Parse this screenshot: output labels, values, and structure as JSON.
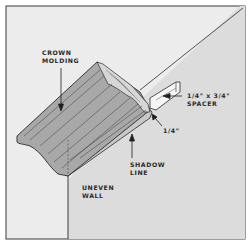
{
  "diagram": {
    "colors": {
      "frame_bg": "#ffffff",
      "frame_border": "#333333",
      "ceiling": "#ececec",
      "back_wall": "#dddddd",
      "left_wall": "#e8e8e8",
      "molding_face": "#a9a9a9",
      "molding_underside": "#c9c9c9",
      "molding_end": "#d4d4d4",
      "spacer": "#f5f5f5",
      "line": "#2b2b2b"
    },
    "labels": {
      "crown_molding_line1": "CROWN",
      "crown_molding_line2": "MOLDING",
      "spacer_line1": "1/4\" x 3/4\"",
      "spacer_line2": "SPACER",
      "gap": "1/4\"",
      "shadow_line1": "SHADOW",
      "shadow_line2": "LINE",
      "wall_line1": "UNEVEN",
      "wall_line2": "WALL"
    }
  }
}
